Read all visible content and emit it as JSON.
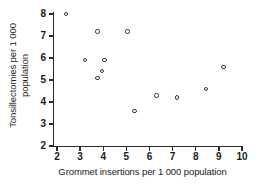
{
  "chart_data": {
    "type": "scatter",
    "title": "",
    "xlabel": "Grommet insertions per 1 000 population",
    "ylabel_line1": "Tonsillectomies per 1 000",
    "ylabel_line2": "population",
    "xlim": [
      1.65,
      10.35
    ],
    "ylim": [
      2.0,
      8.3
    ],
    "grid": false,
    "legend": null,
    "xticks": [
      "2",
      "3",
      "4",
      "5",
      "6",
      "7",
      "8",
      "9",
      "10"
    ],
    "xtick_values": [
      2,
      3,
      4,
      5,
      6,
      7,
      8,
      9,
      10
    ],
    "yticks": [
      "2",
      "3",
      "4",
      "5",
      "6",
      "7",
      "8"
    ],
    "ytick_values": [
      2,
      3,
      4,
      5,
      6,
      7,
      8
    ],
    "marker": "open-circle",
    "marker_color": "#3a3a3a",
    "points": [
      {
        "x": 2.4,
        "y": 8.0
      },
      {
        "x": 3.75,
        "y": 7.2
      },
      {
        "x": 5.05,
        "y": 7.2
      },
      {
        "x": 3.2,
        "y": 5.9
      },
      {
        "x": 4.05,
        "y": 5.9
      },
      {
        "x": 9.2,
        "y": 5.6
      },
      {
        "x": 3.95,
        "y": 5.4
      },
      {
        "x": 3.75,
        "y": 5.1
      },
      {
        "x": 8.45,
        "y": 4.6
      },
      {
        "x": 6.3,
        "y": 4.3
      },
      {
        "x": 7.2,
        "y": 4.2
      },
      {
        "x": 5.35,
        "y": 3.6
      }
    ]
  }
}
